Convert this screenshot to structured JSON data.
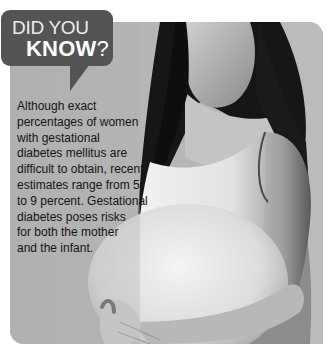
{
  "callout": {
    "line1": "DID YOU",
    "line2_main": "KNOW",
    "line2_punct": "?",
    "bubble_color": "#545454",
    "text_color": "#ffffff"
  },
  "fact": {
    "lines": [
      "Although exact",
      "percentages of women",
      "with gestational",
      "diabetes mellitus are",
      "difficult to obtain, recent",
      "estimates range from 5",
      "to 9 percent. Gestational",
      "diabetes poses risks",
      "for both the mother",
      "and the infant."
    ],
    "full_text": "Although exact percentages of women with gestational diabetes mellitus are difficult to obtain, recent estimates range from 5 to 9 percent. Gestational diabetes poses risks for both the mother and the infant."
  },
  "photo": {
    "subject": "pregnant-woman-photo",
    "style": "grayscale",
    "background_color": "#b4b4b4"
  }
}
